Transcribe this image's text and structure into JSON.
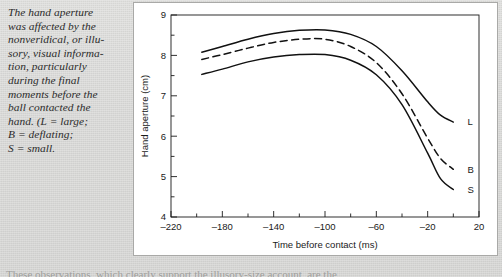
{
  "caption": {
    "text": "The hand aperture\nwas affected by the\nnonveridical, or illu-\nsory, visual informa-\ntion, particularly\nduring the final\nmoments before the\nball contacted the\nhand. (L = large;\nB = deflating;\nS = small."
  },
  "body_sliver": {
    "text": "These observations, which clearly support the illusory-size account, are the"
  },
  "chart_data": {
    "type": "line",
    "title": "",
    "xlabel": "Time before contact (ms)",
    "ylabel": "Hand aperture (cm)",
    "xlim": [
      -220,
      20
    ],
    "ylim": [
      4,
      9
    ],
    "xticks": [
      -220,
      -180,
      -140,
      -100,
      -60,
      -20,
      20
    ],
    "xticklabels": [
      "–220",
      "–180",
      "–140",
      "–100",
      "–60",
      "–20",
      "20"
    ],
    "xminor_step": 20,
    "yticks": [
      4,
      5,
      6,
      7,
      8,
      9
    ],
    "yticklabels": [
      "4",
      "5",
      "6",
      "7",
      "8",
      "9"
    ],
    "yminor_step": 0.5,
    "grid": false,
    "legend_position": "curve-end-labels",
    "series": [
      {
        "name": "L",
        "label": "L",
        "description": "large",
        "style": "solid",
        "color": "#111111",
        "x": [
          -196,
          -180,
          -160,
          -140,
          -120,
          -100,
          -80,
          -60,
          -40,
          -20,
          -10,
          0
        ],
        "y": [
          8.08,
          8.22,
          8.4,
          8.54,
          8.62,
          8.63,
          8.52,
          8.22,
          7.62,
          6.85,
          6.52,
          6.35
        ]
      },
      {
        "name": "B",
        "label": "B",
        "description": "deflating",
        "style": "dashed",
        "color": "#111111",
        "x": [
          -196,
          -180,
          -160,
          -140,
          -120,
          -100,
          -80,
          -60,
          -40,
          -20,
          -10,
          0
        ],
        "y": [
          7.9,
          8.02,
          8.18,
          8.32,
          8.4,
          8.4,
          8.22,
          7.82,
          7.05,
          5.95,
          5.45,
          5.18
        ]
      },
      {
        "name": "S",
        "label": "S",
        "description": "small",
        "style": "solid",
        "color": "#111111",
        "x": [
          -196,
          -180,
          -160,
          -140,
          -120,
          -100,
          -80,
          -60,
          -40,
          -20,
          -10,
          0
        ],
        "y": [
          7.53,
          7.66,
          7.84,
          7.96,
          8.02,
          8.02,
          7.88,
          7.52,
          6.78,
          5.58,
          4.95,
          4.68
        ]
      }
    ],
    "curve_end_labels": [
      {
        "label": "L",
        "x": 8,
        "y": 6.35
      },
      {
        "label": "B",
        "x": 8,
        "y": 5.18
      },
      {
        "label": "S",
        "x": 8,
        "y": 4.68
      }
    ]
  }
}
